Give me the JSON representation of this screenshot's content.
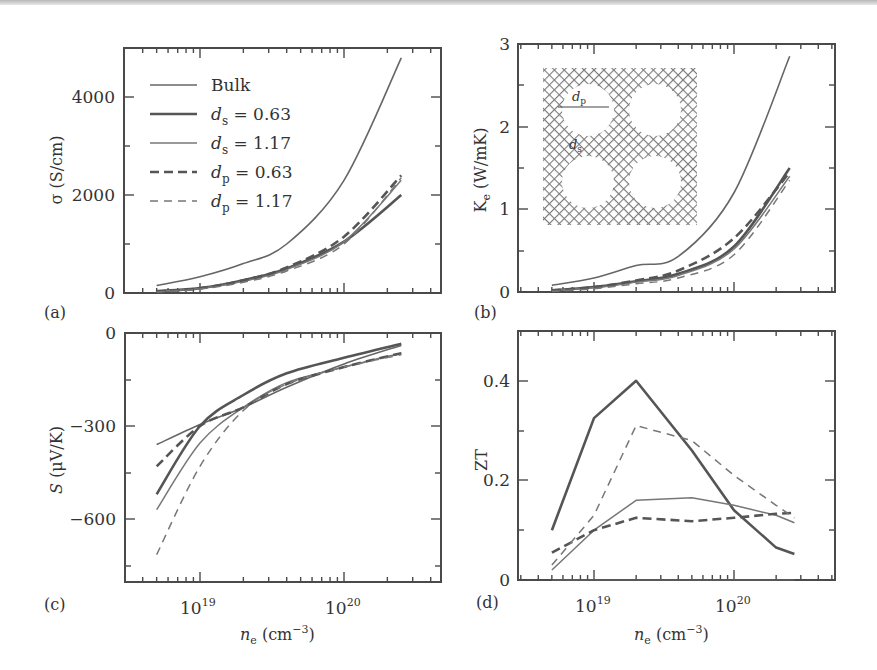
{
  "figure": {
    "panels": [
      "(a)",
      "(b)",
      "(c)",
      "(d)"
    ],
    "xlabel": "n_e (cm^-3)",
    "x_ticks": [
      "10^19",
      "10^20"
    ]
  },
  "legend": [
    {
      "label": "Bulk",
      "style": "solid-thin"
    },
    {
      "label": "d_s = 0.63",
      "style": "solid-thick"
    },
    {
      "label": "d_s = 1.17",
      "style": "solid-thin-light"
    },
    {
      "label": "d_p = 0.63",
      "style": "dashed-thick"
    },
    {
      "label": "d_p = 1.17",
      "style": "dashed-thin"
    }
  ],
  "inset": {
    "labels": [
      "d_p",
      "d_s"
    ],
    "description": "porous silicon lattice with four circular pores"
  },
  "colors": {
    "line": "#5a5a5a",
    "frame": "#4a4a4a",
    "text": "#333333"
  },
  "chart_data": [
    {
      "panel": "(a)",
      "type": "line",
      "title": "",
      "xlabel": "n_e (cm^-3)",
      "ylabel": "σ (S/cm)",
      "xscale": "log",
      "xlim": [
        3e+18,
        5e+20
      ],
      "ylim": [
        0,
        5000
      ],
      "yticks": [
        0,
        2000,
        4000
      ],
      "x": [
        5e+18,
        1e+19,
        2e+19,
        4e+19,
        1e+20,
        2.5e+20
      ],
      "series": [
        {
          "name": "Bulk",
          "values": [
            150,
            330,
            600,
            1000,
            2300,
            4800
          ]
        },
        {
          "name": "d_s = 0.63",
          "values": [
            40,
            100,
            260,
            500,
            1050,
            2000
          ]
        },
        {
          "name": "d_s = 1.17",
          "values": [
            30,
            90,
            240,
            480,
            1050,
            2300
          ]
        },
        {
          "name": "d_p = 0.63",
          "values": [
            30,
            95,
            260,
            520,
            1150,
            2400
          ]
        },
        {
          "name": "d_p = 1.17",
          "values": [
            20,
            80,
            220,
            450,
            1000,
            2350
          ]
        }
      ]
    },
    {
      "panel": "(b)",
      "type": "line",
      "xlabel": "n_e (cm^-3)",
      "ylabel": "K_e (W/mK)",
      "xscale": "log",
      "xlim": [
        3e+18,
        5e+20
      ],
      "ylim": [
        0,
        3
      ],
      "yticks": [
        0,
        1,
        2,
        3
      ],
      "x": [
        5e+18,
        1e+19,
        2e+19,
        4e+19,
        1e+20,
        2.5e+20
      ],
      "series": [
        {
          "name": "Bulk",
          "values": [
            0.08,
            0.17,
            0.32,
            0.43,
            1.2,
            2.85
          ]
        },
        {
          "name": "d_s = 0.63",
          "values": [
            0.02,
            0.06,
            0.13,
            0.22,
            0.55,
            1.5
          ]
        },
        {
          "name": "d_s = 1.17",
          "values": [
            0.02,
            0.05,
            0.12,
            0.2,
            0.52,
            1.4
          ]
        },
        {
          "name": "d_p = 0.63",
          "values": [
            0.02,
            0.06,
            0.14,
            0.26,
            0.65,
            1.45
          ]
        },
        {
          "name": "d_p = 1.17",
          "values": [
            0.01,
            0.04,
            0.1,
            0.17,
            0.45,
            1.35
          ]
        }
      ]
    },
    {
      "panel": "(c)",
      "type": "line",
      "xlabel": "n_e (cm^-3)",
      "ylabel": "S (μV/K)",
      "xscale": "log",
      "xlim": [
        3e+18,
        5e+20
      ],
      "ylim": [
        -800,
        0
      ],
      "yticks": [
        -600,
        -300,
        0
      ],
      "x": [
        5e+18,
        1e+19,
        2e+19,
        4e+19,
        1e+20,
        2.5e+20
      ],
      "series": [
        {
          "name": "Bulk",
          "values": [
            -360,
            -295,
            -240,
            -175,
            -100,
            -40
          ]
        },
        {
          "name": "d_s = 0.63",
          "values": [
            -520,
            -300,
            -200,
            -130,
            -80,
            -35
          ]
        },
        {
          "name": "d_s = 1.17",
          "values": [
            -570,
            -355,
            -240,
            -160,
            -110,
            -65
          ]
        },
        {
          "name": "d_p = 0.63",
          "values": [
            -430,
            -300,
            -240,
            -165,
            -110,
            -65
          ]
        },
        {
          "name": "d_p = 1.17",
          "values": [
            -715,
            -430,
            -250,
            -165,
            -110,
            -70
          ]
        }
      ]
    },
    {
      "panel": "(d)",
      "type": "line",
      "xlabel": "n_e (cm^-3)",
      "ylabel": "ZT",
      "xscale": "log",
      "xlim": [
        3e+18,
        5e+20
      ],
      "ylim": [
        0,
        0.5
      ],
      "yticks": [
        0,
        0.2,
        0.4
      ],
      "x": [
        5e+18,
        1e+19,
        2e+19,
        5e+19,
        1e+20,
        2e+20,
        2.7e+20
      ],
      "series": [
        {
          "name": "Bulk",
          "values": [
            0.0,
            0.0,
            0.0,
            0.0,
            0.0,
            0.0,
            0.0
          ]
        },
        {
          "name": "d_s = 0.63",
          "values": [
            0.1,
            0.325,
            0.4,
            0.26,
            0.14,
            0.065,
            0.052
          ]
        },
        {
          "name": "d_s = 1.17",
          "values": [
            0.02,
            0.1,
            0.16,
            0.165,
            0.15,
            0.13,
            0.115
          ]
        },
        {
          "name": "d_p = 0.63",
          "values": [
            0.055,
            0.1,
            0.125,
            0.118,
            0.125,
            0.133,
            0.135
          ]
        },
        {
          "name": "d_p = 1.17",
          "values": [
            0.03,
            0.13,
            0.31,
            0.28,
            0.21,
            0.15,
            0.125
          ]
        }
      ]
    }
  ]
}
